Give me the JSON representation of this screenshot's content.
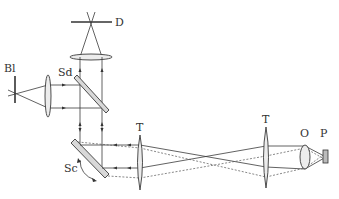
{
  "diagram": {
    "type": "optical-setup",
    "labels": {
      "detector": "D",
      "blocker": "Bl",
      "dichroic_splitter": "Sd",
      "scanner": "Sc",
      "tube_lens_1": "T",
      "tube_lens_2": "T",
      "objective": "O",
      "sample": "P"
    },
    "colors": {
      "line": "#3a3a3a",
      "lens_fill": "#ececec",
      "plate_fill": "#d8d8d8",
      "background": "#ffffff"
    }
  }
}
